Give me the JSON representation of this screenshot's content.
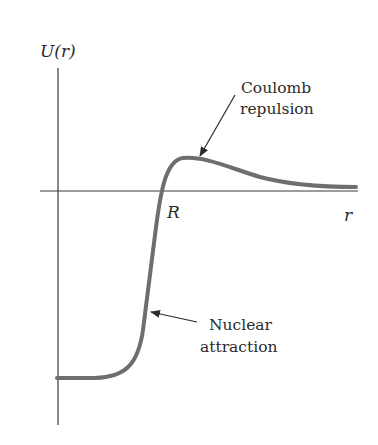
{
  "figure": {
    "type": "potential-energy-diagram",
    "y_axis_label": "U(r)",
    "x_axis_label": "r",
    "marker_label": "R",
    "annotations": [
      {
        "id": "coulomb",
        "lines": [
          "Coulomb",
          "repulsion"
        ]
      },
      {
        "id": "nuclear",
        "lines": [
          "Nuclear",
          "attraction"
        ]
      }
    ],
    "colors": {
      "axis": "#3a3a3a",
      "curve": "#6e6e6e",
      "text": "#2b2b2b",
      "background": "#ffffff"
    }
  }
}
